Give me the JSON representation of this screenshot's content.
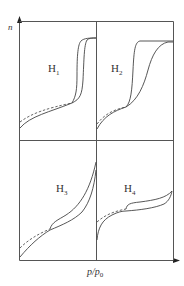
{
  "diagram": {
    "title": "",
    "y_axis_label": "n",
    "x_axis_label_p": "p",
    "x_axis_label_sep": "/",
    "x_axis_label_p0": "p",
    "x_axis_label_sub": "0",
    "panels": [
      {
        "id": "H1",
        "letter": "H",
        "sub": "1",
        "position": "top-left"
      },
      {
        "id": "H2",
        "letter": "H",
        "sub": "2",
        "position": "top-right"
      },
      {
        "id": "H3",
        "letter": "H",
        "sub": "3",
        "position": "bottom-left"
      },
      {
        "id": "H4",
        "letter": "H",
        "sub": "4",
        "position": "bottom-right"
      }
    ],
    "legend": {
      "solid": "adsorption / desorption branches",
      "dashed": "extrapolated branch"
    }
  }
}
